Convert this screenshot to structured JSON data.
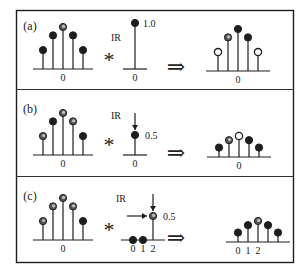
{
  "figure": {
    "ink_color": "#1e1e1e",
    "panels": [
      {
        "label": "(a)",
        "operator": "*",
        "result_arrow": "⇒",
        "input": {
          "origin_label": "0",
          "samples": [
            {
              "n": -2,
              "value": 0.45,
              "marker": "filled"
            },
            {
              "n": -1,
              "value": 0.8,
              "marker": "filled"
            },
            {
              "n": 0,
              "value": 1.0,
              "marker": "gray"
            },
            {
              "n": 1,
              "value": 0.8,
              "marker": "filled"
            },
            {
              "n": 2,
              "value": 0.45,
              "marker": "filled"
            }
          ]
        },
        "ir": {
          "label": "IR",
          "value_label": "1.0",
          "tick_labels": [
            "0"
          ],
          "arrows": [],
          "samples": [
            {
              "n": 0,
              "value": 1.0,
              "marker": "filled"
            }
          ]
        },
        "output": {
          "tick_labels": [
            "0"
          ],
          "origin_index": 2,
          "samples": [
            {
              "n": -2,
              "value": 0.45,
              "marker": "hollow"
            },
            {
              "n": -1,
              "value": 0.8,
              "marker": "gray"
            },
            {
              "n": 0,
              "value": 1.0,
              "marker": "filled"
            },
            {
              "n": 1,
              "value": 0.8,
              "marker": "filled"
            },
            {
              "n": 2,
              "value": 0.45,
              "marker": "hollow"
            }
          ]
        }
      },
      {
        "label": "(b)",
        "operator": "*",
        "result_arrow": "⇒",
        "input": {
          "origin_label": "0",
          "samples": [
            {
              "n": -2,
              "value": 0.45,
              "marker": "gray"
            },
            {
              "n": -1,
              "value": 0.8,
              "marker": "filled"
            },
            {
              "n": 0,
              "value": 1.0,
              "marker": "gray"
            },
            {
              "n": 1,
              "value": 0.8,
              "marker": "gray"
            },
            {
              "n": 2,
              "value": 0.45,
              "marker": "filled"
            }
          ]
        },
        "ir": {
          "label": "IR",
          "value_label": "0.5",
          "tick_labels": [
            "0"
          ],
          "arrows": [
            "down"
          ],
          "samples": [
            {
              "n": 0,
              "value": 0.5,
              "marker": "filled"
            }
          ]
        },
        "output": {
          "tick_labels": [
            "0"
          ],
          "origin_index": 2,
          "samples": [
            {
              "n": -2,
              "value": 0.225,
              "marker": "filled"
            },
            {
              "n": -1,
              "value": 0.4,
              "marker": "gray"
            },
            {
              "n": 0,
              "value": 0.5,
              "marker": "hollow"
            },
            {
              "n": 1,
              "value": 0.4,
              "marker": "filled"
            },
            {
              "n": 2,
              "value": 0.225,
              "marker": "filled"
            }
          ]
        }
      },
      {
        "label": "(c)",
        "operator": "*",
        "result_arrow": "⇒",
        "input": {
          "origin_label": "0",
          "samples": [
            {
              "n": -2,
              "value": 0.45,
              "marker": "gray"
            },
            {
              "n": -1,
              "value": 0.8,
              "marker": "gray"
            },
            {
              "n": 0,
              "value": 1.0,
              "marker": "gray"
            },
            {
              "n": 1,
              "value": 0.8,
              "marker": "gray"
            },
            {
              "n": 2,
              "value": 0.45,
              "marker": "filled"
            }
          ]
        },
        "ir": {
          "label": "IR",
          "value_label": "0.5",
          "tick_labels": [
            "0",
            "1",
            "2"
          ],
          "arrows": [
            "down",
            "right"
          ],
          "samples": [
            {
              "n": 0,
              "value": 0,
              "marker": "filled"
            },
            {
              "n": 1,
              "value": 0,
              "marker": "filled"
            },
            {
              "n": 2,
              "value": 0.5,
              "marker": "gray"
            }
          ]
        },
        "output": {
          "tick_labels": [
            "0",
            "1",
            "2"
          ],
          "origin_index": 0,
          "samples": [
            {
              "n": 0,
              "value": 0.225,
              "marker": "filled"
            },
            {
              "n": 1,
              "value": 0.4,
              "marker": "filled"
            },
            {
              "n": 2,
              "value": 0.5,
              "marker": "gray"
            },
            {
              "n": 3,
              "value": 0.4,
              "marker": "filled"
            },
            {
              "n": 4,
              "value": 0.225,
              "marker": "filled"
            }
          ]
        }
      }
    ]
  }
}
